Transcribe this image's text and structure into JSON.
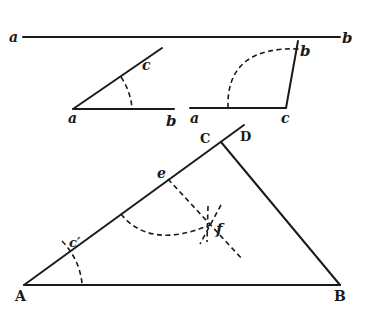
{
  "figure": {
    "ink_color": "#1a1a1a",
    "background": "#ffffff"
  },
  "segment_ab": {
    "label_a": "a",
    "label_b": "b"
  },
  "angle_one": {
    "label_vertex": "a",
    "label_end": "b",
    "label_ray": "c"
  },
  "angle_two": {
    "label_start": "a",
    "label_vertex": "c",
    "label_ray": "b"
  },
  "triangle": {
    "label_A": "A",
    "label_B": "B",
    "label_C": "C",
    "label_D": "D",
    "label_e": "e",
    "label_f": "f",
    "label_c_prime": "c′"
  }
}
